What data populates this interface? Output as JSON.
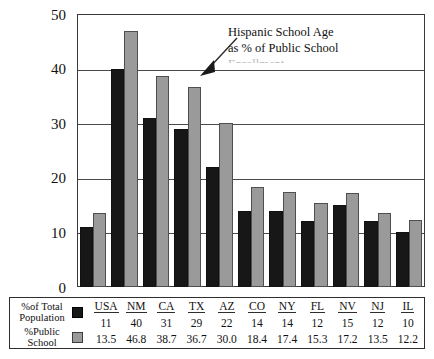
{
  "chart_data": {
    "type": "bar",
    "title": "",
    "xlabel": "",
    "ylabel": "",
    "ylim": [
      0,
      50
    ],
    "yticks": [
      0,
      10,
      20,
      30,
      40,
      50
    ],
    "grid": true,
    "legend_position": "bottom-table",
    "categories": [
      "USA",
      "NM",
      "CA",
      "TX",
      "AZ",
      "CO",
      "NY",
      "FL",
      "NV",
      "NJ",
      "IL"
    ],
    "series": [
      {
        "name": "%of Total Population",
        "color": "#171717",
        "values": [
          11,
          40,
          31,
          29,
          22,
          14,
          14,
          12,
          15,
          12,
          10
        ],
        "display": [
          "11",
          "40",
          "31",
          "29",
          "22",
          "14",
          "14",
          "12",
          "15",
          "12",
          "10"
        ]
      },
      {
        "name": "%Public School",
        "color": "#9a9a9a",
        "values": [
          13.5,
          46.8,
          38.7,
          36.7,
          30.0,
          18.4,
          17.4,
          15.3,
          17.2,
          13.5,
          12.2
        ],
        "display": [
          "13.5",
          "46.8",
          "38.7",
          "36.7",
          "30.0",
          "18.4",
          "17.4",
          "15.3",
          "17.2",
          "13.5",
          "12.2"
        ]
      }
    ],
    "annotations": [
      {
        "name": "hispanic-school-age-callout",
        "line1": "Hispanic School Age",
        "line2": "as % of Public School",
        "line3": "Enrollment"
      }
    ]
  },
  "legend": {
    "series1_label_line1": "%of  Total",
    "series1_label_line2": "Population",
    "series2_label_line1": "%Public",
    "series2_label_line2": "School",
    "swatch1_name": "black-swatch",
    "swatch2_name": "gray-swatch"
  },
  "axis": {
    "y_tick_0": "0",
    "y_tick_1": "10",
    "y_tick_2": "20",
    "y_tick_3": "30",
    "y_tick_4": "40",
    "y_tick_5": "50"
  },
  "colors": {
    "series_total": "#171717",
    "series_public": "#9a9a9a",
    "frame": "#3a3a3a",
    "background": "#ffffff"
  }
}
